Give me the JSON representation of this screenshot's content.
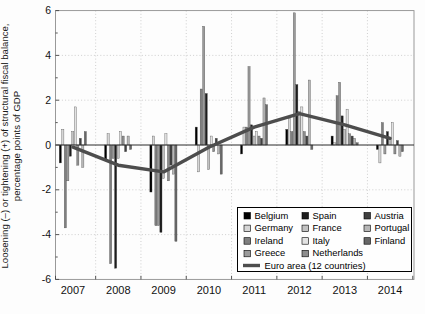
{
  "y_axis": {
    "label_line1": "Loosening (–) or tightening (+) of structural fiscal balance,",
    "label_line2": "percentage points of GDP",
    "tick_labels": [
      "6",
      "4",
      "2",
      "0",
      "-2",
      "-4",
      "-6"
    ],
    "tick_values": [
      6,
      4,
      2,
      0,
      -2,
      -4,
      -6
    ]
  },
  "x_axis": {
    "tick_labels": [
      "2007",
      "2008",
      "2009",
      "2010",
      "2011",
      "2012",
      "2013",
      "2014"
    ]
  },
  "legend": {
    "columns": [
      [
        "Belgium",
        "Germany",
        "Ireland",
        "Greece"
      ],
      [
        "Spain",
        "France",
        "Italy",
        "Netherlands"
      ],
      [
        "Austria",
        "Portugal",
        "Finland"
      ]
    ],
    "line_label": "Euro area (12 countries)"
  },
  "chart_data": {
    "type": "bar",
    "categories": [
      "2007",
      "2008",
      "2009",
      "2010",
      "2011",
      "2012",
      "2013",
      "2014"
    ],
    "title": "",
    "xlabel": "",
    "ylabel": "Loosening (–) or tightening (+) of structural fiscal balance, percentage points of GDP",
    "ylim": [
      -6,
      6
    ],
    "ytick_step": 2,
    "grid": "dotted",
    "legend_position": "inside-bottom-right",
    "series": [
      {
        "name": "Belgium",
        "color": "#000000",
        "values": [
          -0.8,
          -0.7,
          -2.1,
          0.8,
          -0.4,
          0.7,
          0.4,
          -0.2
        ]
      },
      {
        "name": "Germany",
        "color": "#d6d6d6",
        "values": [
          0.7,
          0.5,
          0.4,
          -1.2,
          0.8,
          1.2,
          0.1,
          -0.8
        ]
      },
      {
        "name": "Ireland",
        "color": "#7f7f7f",
        "values": [
          -3.7,
          -5.3,
          -3.6,
          2.5,
          0.8,
          0.6,
          2.2,
          1.0
        ]
      },
      {
        "name": "Greece",
        "color": "#9a9a9a",
        "values": [
          -1.6,
          -0.6,
          -3.6,
          5.3,
          3.5,
          5.9,
          2.8,
          -0.4
        ]
      },
      {
        "name": "Spain",
        "color": "#1c1c1c",
        "values": [
          -0.5,
          -5.5,
          -3.9,
          2.3,
          0.9,
          2.7,
          1.3,
          0.6
        ]
      },
      {
        "name": "France",
        "color": "#c2c2c2",
        "values": [
          0.6,
          -0.6,
          -1.5,
          -1.1,
          0.4,
          1.5,
          0.7,
          0.3
        ]
      },
      {
        "name": "Italy",
        "color": "#e2e2e2",
        "values": [
          1.7,
          0.6,
          0.5,
          0.4,
          0.6,
          1.7,
          1.6,
          1.0
        ]
      },
      {
        "name": "Netherlands",
        "color": "#8d8d8d",
        "values": [
          -0.9,
          0.4,
          -1.6,
          -0.3,
          0.4,
          0.6,
          0.5,
          -0.4
        ]
      },
      {
        "name": "Austria",
        "color": "#3f3f3f",
        "values": [
          0.3,
          -0.3,
          -0.9,
          0.3,
          0.3,
          0.4,
          0.4,
          0.2
        ]
      },
      {
        "name": "Portugal",
        "color": "#b7b7b7",
        "values": [
          -1.0,
          0.4,
          -1.3,
          -0.4,
          2.1,
          2.9,
          0.3,
          -0.5
        ]
      },
      {
        "name": "Finland",
        "color": "#676767",
        "values": [
          0.6,
          -0.2,
          -4.3,
          -1.3,
          1.8,
          -0.2,
          0.1,
          -0.3
        ]
      }
    ],
    "line_series": {
      "name": "Euro area (12 countries)",
      "color": "#4d4d4d",
      "values": [
        -0.1,
        -0.9,
        -1.2,
        -0.1,
        0.8,
        1.4,
        0.9,
        0.3
      ]
    }
  }
}
